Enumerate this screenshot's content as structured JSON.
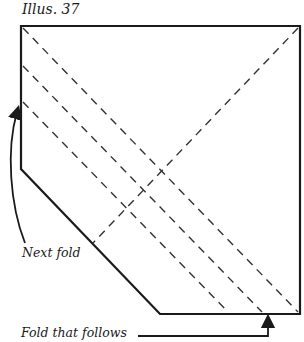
{
  "title": "Illus. 37",
  "labels": {
    "next_fold": "Next fold",
    "fold_that_follows": "Fold that follows"
  },
  "colors": {
    "outline": "#1a1a1a",
    "dashed": "#333333",
    "background": "#ffffff"
  },
  "diagram": {
    "shape": "square with lower-left corner cut diagonally",
    "outline_vertices": [
      [
        21,
        26
      ],
      [
        300,
        26
      ],
      [
        300,
        314
      ],
      [
        160,
        314
      ],
      [
        21,
        169
      ]
    ],
    "dashed_lines": [
      {
        "name": "main-diagonal",
        "from": [
          23,
          28
        ],
        "to": [
          298,
          312
        ]
      },
      {
        "name": "parallel-fold-1",
        "from": [
          23,
          66
        ],
        "to": [
          262,
          312
        ]
      },
      {
        "name": "parallel-fold-2",
        "from": [
          23,
          102
        ],
        "to": [
          228,
          312
        ]
      },
      {
        "name": "anti-diagonal",
        "from": [
          298,
          28
        ],
        "to": [
          93,
          243
        ]
      }
    ],
    "arrows": [
      {
        "name": "next-fold-arrow",
        "points_to": "left edge near parallel-fold-2 start"
      },
      {
        "name": "fold-that-follows-arrow",
        "points_to": "bottom edge near parallel-fold-1 end"
      }
    ]
  }
}
